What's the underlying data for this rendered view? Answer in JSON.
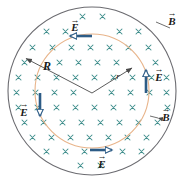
{
  "figure": {
    "type": "physics-diagram",
    "width": 185,
    "height": 183
  },
  "colors": {
    "outer_circle": "#6b6b70",
    "inner_circle": "#e8b48a",
    "field_marks": "#3f8e8c",
    "vector": "#2d5c86",
    "vector_fill": "#ffffff",
    "leader_line": "#4a4a4a",
    "label_text": "#1a1a1a",
    "background": "#ffffff"
  },
  "circles": {
    "outer": {
      "label": "R",
      "cx": 92,
      "cy": 91,
      "r": 84
    },
    "inner": {
      "label": "r",
      "cx": 92,
      "cy": 91,
      "r": 57
    }
  },
  "radii": [
    {
      "name": "R",
      "label": "R",
      "label_x": 47,
      "label_y": 66,
      "from_x": 92,
      "from_y": 93,
      "to_x": 25,
      "to_y": 58
    },
    {
      "name": "r",
      "label": "r",
      "label_x": 118,
      "label_y": 76,
      "from_x": 92,
      "from_y": 93,
      "to_x": 133,
      "to_y": 67
    }
  ],
  "field_symbol": {
    "name": "magnetic-field-into-page",
    "glyph": "×",
    "meaning": "B into page"
  },
  "vectors": [
    {
      "name": "E-top",
      "label": "E",
      "direction": "left",
      "label_x": 73,
      "label_y": 24
    },
    {
      "name": "E-right",
      "label": "E",
      "direction": "up",
      "label_x": 156,
      "label_y": 78
    },
    {
      "name": "E-left",
      "label": "E",
      "direction": "down",
      "label_x": 23,
      "label_y": 113
    },
    {
      "name": "E-bottom",
      "label": "E",
      "direction": "right",
      "label_x": 101,
      "label_y": 167
    }
  ],
  "b_labels": [
    {
      "name": "B-outside",
      "label": "B",
      "x": 168,
      "y": 22
    },
    {
      "name": "B-inside",
      "label": "B",
      "x": 163,
      "y": 118
    }
  ],
  "arrow_accent": "→"
}
